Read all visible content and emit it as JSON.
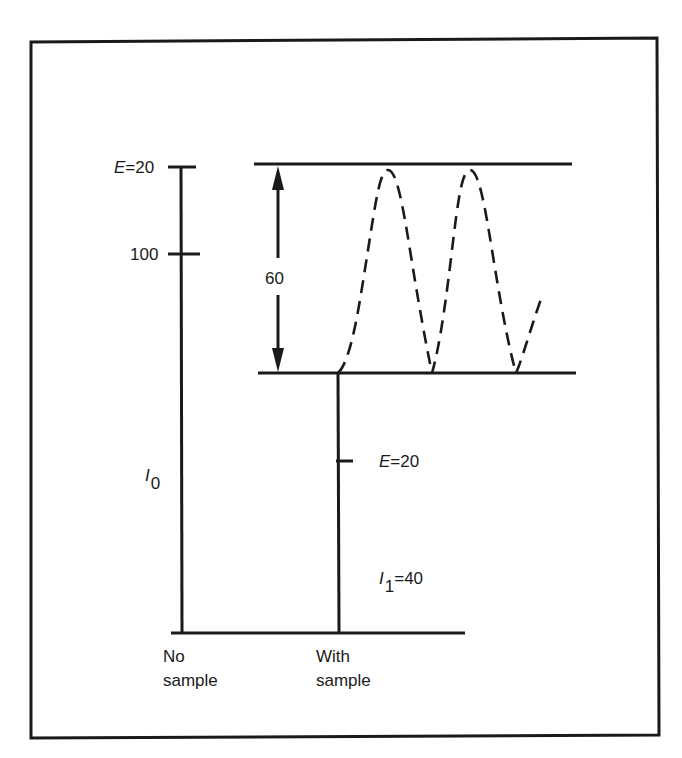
{
  "diagram": {
    "type": "energy/intensity level diagram",
    "frame": {
      "stroke": "#1a1a1a"
    },
    "left_bar": {
      "top_label": {
        "var": "E",
        "value": "=20"
      },
      "mid_label": "100",
      "intensity_label": {
        "var": "I",
        "sub": "0"
      },
      "bottom_label": [
        "No",
        "sample"
      ]
    },
    "range_arrow": {
      "label": "60"
    },
    "right_bar": {
      "tick_label": {
        "var": "E",
        "value": "=20"
      },
      "intensity_label": {
        "var": "I",
        "sub": "1",
        "value": "=40"
      },
      "bottom_label": [
        "With",
        "sample"
      ]
    },
    "oscillation": {
      "style": "dashed",
      "peaks": 2
    },
    "colors": {
      "ink": "#1a1a1a",
      "background": "#ffffff"
    }
  }
}
